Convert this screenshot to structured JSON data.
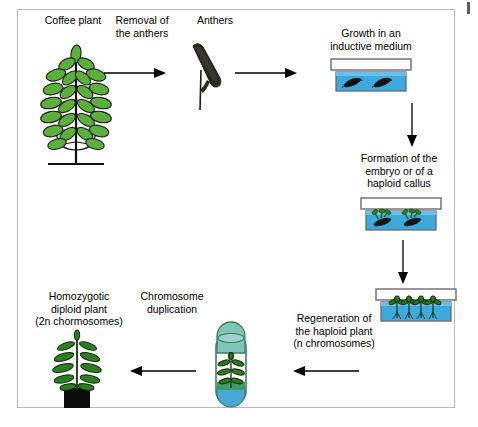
{
  "diagram": {
    "title_visible": false,
    "border_color": "#b9b9b9",
    "background": "#ffffff"
  },
  "colors": {
    "leaf_green": "#5cb039",
    "leaf_green_dark": "#2f7d23",
    "leaf_outline": "#1d1d1d",
    "medium_blue": "#3ea9dd",
    "medium_blue_dark": "#1f8fc4",
    "dish_lid_white": "#ffffff",
    "dish_border": "#6b6b6b",
    "anther_dark": "#2b2a22",
    "tube_cap_teal": "#7fc4b9",
    "tube_liquid_blue": "#4aa8d8",
    "tube_soil_green": "#3f9b6e",
    "pot_black": "#0b0b0b",
    "arrow_black": "#000000",
    "text_black": "#000000"
  },
  "labels": {
    "coffee_plant": "Coffee plant",
    "removal_of_anthers": "Removal of\nthe anthers",
    "anthers": "Anthers",
    "growth_medium": "Growth in an\ninductive medium",
    "formation_embryo": "Formation of the\nembryo or of a\nhaploid callus",
    "regeneration_haploid": "Regeneration of\nthe haploid plant\n(n chromosomes)",
    "chromosome_duplication": "Chromosome\nduplication",
    "homozygotic_diploid": "Homozygotic\ndiploid plant\n(2n chormosomes)"
  },
  "nodes": [
    {
      "id": "coffee-plant",
      "kind": "illustration",
      "name": "coffee-plant-illustration"
    },
    {
      "id": "anthers",
      "kind": "illustration",
      "name": "anthers-illustration"
    },
    {
      "id": "dish-inductive",
      "kind": "petri-dish",
      "name": "petri-dish-inductive-medium",
      "contents": "anthers"
    },
    {
      "id": "dish-embryo",
      "kind": "petri-dish",
      "name": "petri-dish-embryo-callus",
      "contents": "callus"
    },
    {
      "id": "dish-regeneration",
      "kind": "petri-dish",
      "name": "petri-dish-regeneration",
      "contents": "plantlets"
    },
    {
      "id": "culture-tube",
      "kind": "test-tube",
      "name": "culture-tube-illustration",
      "contents": "plantlet"
    },
    {
      "id": "diploid-plant",
      "kind": "illustration",
      "name": "diploid-plant-illustration"
    }
  ],
  "arrows": [
    {
      "id": "a1",
      "name": "arrow-plant-to-anthers",
      "direction": "right"
    },
    {
      "id": "a2",
      "name": "arrow-anthers-to-dish",
      "direction": "right"
    },
    {
      "id": "a3",
      "name": "arrow-dish-to-embryo",
      "direction": "down"
    },
    {
      "id": "a4",
      "name": "arrow-embryo-to-regeneration",
      "direction": "down"
    },
    {
      "id": "a5",
      "name": "arrow-regeneration-to-tube",
      "direction": "left"
    },
    {
      "id": "a6",
      "name": "arrow-tube-to-diploid-plant",
      "direction": "left"
    }
  ]
}
